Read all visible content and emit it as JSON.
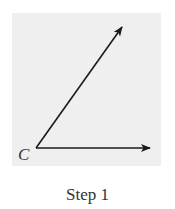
{
  "diagram": {
    "vertex_label": "C",
    "caption": "Step 1",
    "colors": {
      "panel_background": "#efefef",
      "ray_stroke": "#1a1a1a",
      "text": "#333333"
    },
    "rays": [
      {
        "name": "horizontal-ray",
        "from": [
          36,
          148
        ],
        "to": [
          150,
          148
        ]
      },
      {
        "name": "diagonal-ray",
        "from": [
          36,
          148
        ],
        "to": [
          122,
          27
        ]
      }
    ]
  }
}
